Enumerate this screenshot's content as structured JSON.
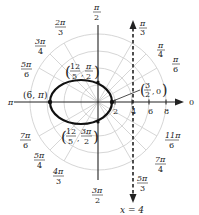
{
  "diagram": {
    "type": "polar-graph",
    "pole": {
      "x": 98,
      "y": 102
    },
    "scale_px_per_unit": 8.5,
    "colors": {
      "grid": "#d6d6d6",
      "axis": "#222222",
      "curve": "#111111",
      "text": "#222222"
    },
    "grid_circles": [
      2,
      4,
      6,
      8
    ],
    "radial_ticks": [
      {
        "label": "2",
        "r": 2
      },
      {
        "label": "4",
        "r": 4
      },
      {
        "label": "6",
        "r": 6
      },
      {
        "label": "8",
        "r": 8
      }
    ],
    "angle_labels": [
      {
        "num": "π",
        "den": "2",
        "deg": 90
      },
      {
        "num": "π",
        "den": "3",
        "deg": 60
      },
      {
        "num": "π",
        "den": "4",
        "deg": 45
      },
      {
        "num": "π",
        "den": "6",
        "deg": 30
      },
      {
        "text": "0",
        "deg": 0
      },
      {
        "num": "11π",
        "den": "6",
        "deg": 330
      },
      {
        "num": "7π",
        "den": "4",
        "deg": 315
      },
      {
        "num": "5π",
        "den": "3",
        "deg": 300
      },
      {
        "num": "3π",
        "den": "2",
        "deg": 270
      },
      {
        "num": "4π",
        "den": "3",
        "deg": 240
      },
      {
        "num": "5π",
        "den": "4",
        "deg": 225
      },
      {
        "num": "7π",
        "den": "6",
        "deg": 210
      },
      {
        "text": "π",
        "deg": 180
      },
      {
        "num": "5π",
        "den": "6",
        "deg": 150
      },
      {
        "num": "3π",
        "den": "4",
        "deg": 135
      },
      {
        "num": "2π",
        "den": "3",
        "deg": 120
      }
    ],
    "curve": {
      "kind": "ellipse",
      "description": "conic with focus at pole",
      "points": [
        {
          "label": "(6, π)",
          "r": "6",
          "theta": "π"
        },
        {
          "label": "(3/2, 0)",
          "r": "3/2",
          "theta": "0"
        },
        {
          "label": "(12/5, π/2)",
          "r": "12/5",
          "theta": "π/2"
        },
        {
          "label": "(12/5, 3π/2)",
          "r": "12/5",
          "theta": "3π/2"
        }
      ]
    },
    "directrix": {
      "label": "x = 4",
      "x": 4,
      "style": "dashed"
    },
    "point_labels": {
      "p_pi": {
        "open": "(",
        "a": "6",
        "sep": ", ",
        "b": "π",
        "close": ")"
      },
      "p_zero": {
        "a_num": "3",
        "a_den": "2",
        "b": "0"
      },
      "p_top": {
        "a_num": "12",
        "a_den": "5",
        "b_num": "π",
        "b_den": "2"
      },
      "p_bottom": {
        "a_num": "12",
        "a_den": "5",
        "b_num": "3π",
        "b_den": "2"
      }
    }
  }
}
